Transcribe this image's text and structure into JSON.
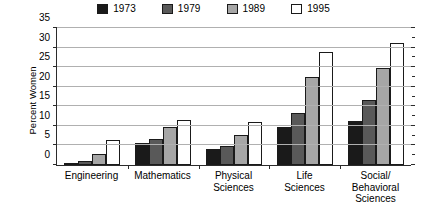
{
  "chart_data": {
    "type": "bar",
    "title": "",
    "xlabel": "",
    "ylabel": "Percent Women",
    "ylim": [
      0,
      35
    ],
    "ytick_step": 5,
    "yticks": [
      0,
      5,
      10,
      15,
      20,
      25,
      30,
      35
    ],
    "grid": true,
    "legend_position": "top-center",
    "categories": [
      "Engineering",
      "Mathematics",
      "Physical Sciences",
      "Life Sciences",
      "Social/Behavioral Sciences"
    ],
    "category_lines": [
      [
        "Engineering"
      ],
      [
        "Mathematics"
      ],
      [
        "Physical",
        "Sciences"
      ],
      [
        "Life",
        "Sciences"
      ],
      [
        "Social/",
        "Behavioral",
        "Sciences"
      ]
    ],
    "series": [
      {
        "name": "1973",
        "color": "#1a1a1a",
        "values": [
          0.4,
          5.6,
          4.1,
          9.8,
          11.3
        ]
      },
      {
        "name": "1979",
        "color": "#595959",
        "values": [
          1.0,
          6.7,
          4.9,
          13.4,
          16.7
        ]
      },
      {
        "name": "1989",
        "color": "#a6a6a6",
        "values": [
          2.8,
          9.7,
          7.7,
          22.4,
          24.9
        ]
      },
      {
        "name": "1995",
        "color": "#ffffff",
        "values": [
          6.3,
          11.4,
          10.9,
          28.8,
          31.2
        ]
      }
    ]
  },
  "style": {
    "axis_color": "#2b2b2b",
    "grid_color": "#b0b0b0",
    "bar_outline": "#1a1a1a",
    "background": "#ffffff"
  }
}
